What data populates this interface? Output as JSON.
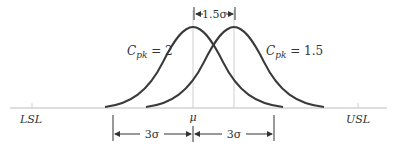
{
  "figure": {
    "labels": {
      "lsl": "LSL",
      "usl": "USL",
      "mu": "μ",
      "shift": "1.5σ",
      "three_sigma_left": "3σ",
      "three_sigma_right": "3σ"
    },
    "curves": [
      {
        "name": "Cpk = 2",
        "label_main": "C",
        "label_sub": "pk",
        "label_value": " = 2",
        "center_x": 193
      },
      {
        "name": "Cpk = 1.5",
        "label_main": "C",
        "label_sub": "pk",
        "label_value": " = 1.5",
        "center_x": 234
      }
    ],
    "colors": {
      "curve": "#3a3a3a",
      "axis": "#bdbdbd",
      "guide": "#cfcfcf",
      "text": "#333333"
    }
  }
}
